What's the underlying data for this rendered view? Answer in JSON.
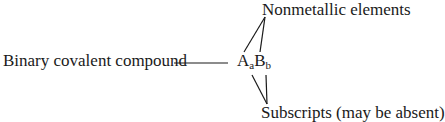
{
  "diagram": {
    "left_label": "Binary covalent compound",
    "formula": {
      "A": "A",
      "a": "a",
      "B": "B",
      "b": "b"
    },
    "top_label": "Nonmetallic elements",
    "bottom_label": "Subscripts (may be absent)"
  }
}
